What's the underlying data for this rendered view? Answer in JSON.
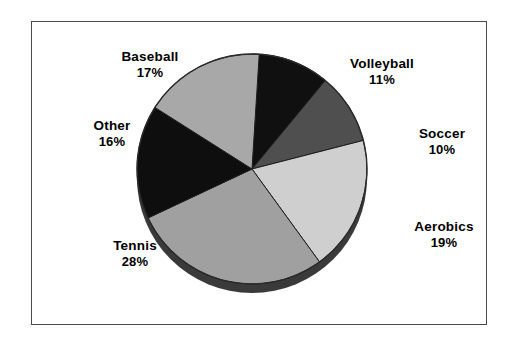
{
  "figure": {
    "background_color": "#ffffff",
    "frame_color": "#4a4a4a"
  },
  "chart_data": {
    "type": "pie",
    "title": "",
    "subtitle": "",
    "xlabel": "",
    "ylabel": "",
    "legend_position": "none",
    "grid": false,
    "units": "percent",
    "total": 101,
    "start_angle_deg": 0,
    "direction": "clockwise",
    "categories": [
      "Volleyball",
      "Soccer",
      "Aerobics",
      "Tennis",
      "Other",
      "Baseball"
    ],
    "values": [
      11,
      10,
      19,
      28,
      16,
      17
    ],
    "labels": [
      "11%",
      "10%",
      "19%",
      "28%",
      "16%",
      "17%"
    ],
    "colors": [
      "#101010",
      "#4f4f4f",
      "#cfcfcf",
      "#a0a0a0",
      "#0e0e0e",
      "#a8a8a8"
    ],
    "slices": [
      {
        "name": "Volleyball",
        "label": "Volleyball",
        "value": 11,
        "percent_text": "11%",
        "color": "#101010",
        "start_deg": 0,
        "end_deg": 39.6
      },
      {
        "name": "Soccer",
        "label": "Soccer",
        "value": 10,
        "percent_text": "10%",
        "color": "#4f4f4f",
        "start_deg": 39.6,
        "end_deg": 75.6
      },
      {
        "name": "Aerobics",
        "label": "Aerobics",
        "value": 19,
        "percent_text": "19%",
        "color": "#cfcfcf",
        "start_deg": 75.6,
        "end_deg": 144.0
      },
      {
        "name": "Tennis",
        "label": "Tennis",
        "value": 28,
        "percent_text": "28%",
        "color": "#a0a0a0",
        "start_deg": 144.0,
        "end_deg": 244.8
      },
      {
        "name": "Other",
        "label": "Other",
        "value": 16,
        "percent_text": "16%",
        "color": "#0e0e0e",
        "start_deg": 244.8,
        "end_deg": 302.4
      },
      {
        "name": "Baseball",
        "label": "Baseball",
        "value": 17,
        "percent_text": "17%",
        "color": "#a8a8a8",
        "start_deg": 302.4,
        "end_deg": 363.6
      }
    ]
  }
}
